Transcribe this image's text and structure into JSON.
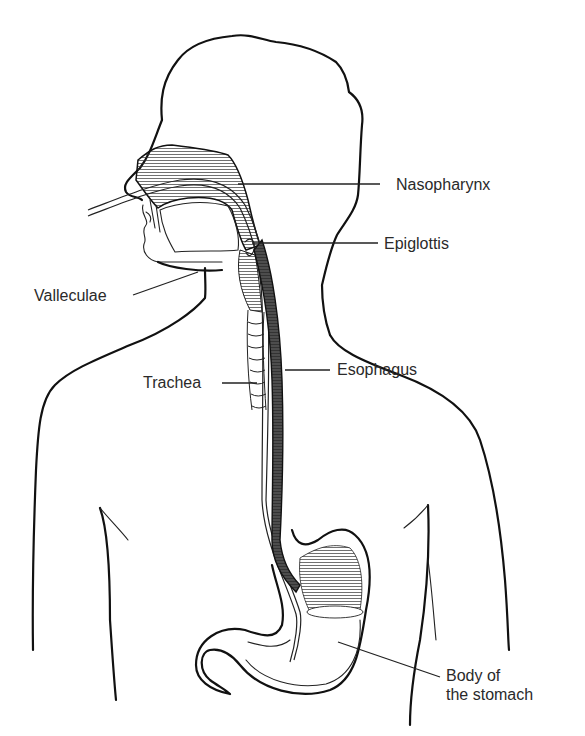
{
  "figure": {
    "labels": {
      "nasopharynx": "Nasopharynx",
      "epiglottis": "Epiglottis",
      "valleculae": "Valleculae",
      "trachea": "Trachea",
      "esophagus": "Esophagus",
      "body_of_stomach": "Body of\nthe stomach"
    },
    "colors": {
      "line": "#111111",
      "text": "#2a2a2a",
      "background": "#ffffff"
    }
  }
}
